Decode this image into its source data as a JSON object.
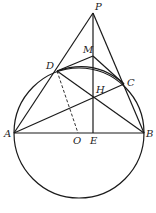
{
  "diagram": {
    "type": "geometry",
    "circle": {
      "center": "O",
      "cx": 79,
      "cy": 133,
      "r": 65
    },
    "points": {
      "P": {
        "x": 93,
        "y": 13,
        "label": "P",
        "lx": 95,
        "ly": 10
      },
      "M": {
        "x": 93,
        "y": 56,
        "label": "M",
        "lx": 83,
        "ly": 53
      },
      "D": {
        "x": 57,
        "y": 71,
        "label": "D",
        "lx": 46,
        "ly": 69
      },
      "C": {
        "x": 124,
        "y": 84,
        "label": "C",
        "lx": 127,
        "ly": 86
      },
      "H": {
        "x": 93,
        "y": 97,
        "label": "H",
        "lx": 96,
        "ly": 93
      },
      "A": {
        "x": 14,
        "y": 133,
        "label": "A",
        "lx": 4,
        "ly": 137
      },
      "O": {
        "x": 78,
        "y": 133,
        "label": "O",
        "lx": 73,
        "ly": 144
      },
      "E": {
        "x": 93,
        "y": 133,
        "label": "E",
        "lx": 90,
        "ly": 144
      },
      "B": {
        "x": 144,
        "y": 133,
        "label": "B",
        "lx": 146,
        "ly": 137
      }
    },
    "segments": [
      [
        "P",
        "A"
      ],
      [
        "P",
        "B"
      ],
      [
        "P",
        "E"
      ],
      [
        "A",
        "B"
      ],
      [
        "D",
        "M"
      ],
      [
        "M",
        "C"
      ],
      [
        "D",
        "B"
      ],
      [
        "A",
        "C"
      ]
    ],
    "dashed_segments": [
      [
        "D",
        "O"
      ]
    ],
    "arcs": [
      {
        "from": "D",
        "to": "C"
      }
    ]
  }
}
